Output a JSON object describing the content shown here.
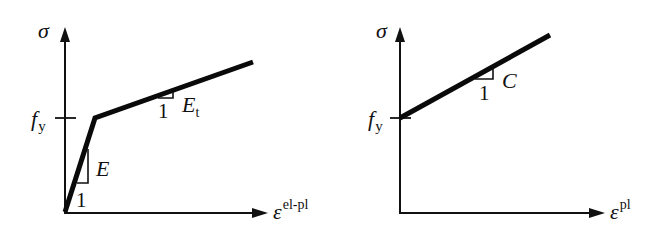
{
  "figure": {
    "left_panel": {
      "y_axis_label": "σ",
      "x_axis_label_base": "ε",
      "x_axis_label_sup": "el-pl",
      "yield_label_base": "f",
      "yield_label_sub": "y",
      "elastic_slope_label": "E",
      "elastic_run_label": "1",
      "tangent_slope_label_base": "E",
      "tangent_slope_label_sub": "t",
      "tangent_run_label": "1"
    },
    "right_panel": {
      "y_axis_label": "σ",
      "x_axis_label_base": "ε",
      "x_axis_label_sup": "pl",
      "yield_label_base": "f",
      "yield_label_sub": "y",
      "hardening_slope_label": "C",
      "hardening_run_label": "1"
    },
    "colors": {
      "line": "#0a0a0a",
      "background": "#ffffff"
    }
  }
}
